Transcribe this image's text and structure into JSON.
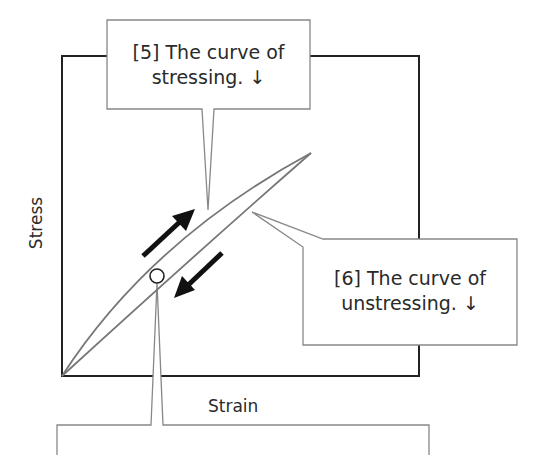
{
  "diagram": {
    "type": "stress-strain hysteresis loop",
    "axes": {
      "x_label": "Strain",
      "y_label": "Stress"
    },
    "callouts": [
      {
        "id": "5",
        "line1": "[5] The curve of",
        "line2": "stressing. ↓",
        "target": "loading curve (upper)"
      },
      {
        "id": "6",
        "line1": "[6] The curve of",
        "line2": "unstressing. ↓",
        "target": "unloading curve (lower)"
      },
      {
        "id": "7",
        "line1": "",
        "line2": "",
        "target": "point on loop (circle marker)"
      }
    ],
    "arrows": [
      {
        "direction": "up-right",
        "meaning": "stressing"
      },
      {
        "direction": "down-left",
        "meaning": "unstressing"
      }
    ],
    "colors": {
      "frame": "#222222",
      "curve": "#777777",
      "callout_border": "#888888",
      "arrow": "#111111"
    }
  }
}
